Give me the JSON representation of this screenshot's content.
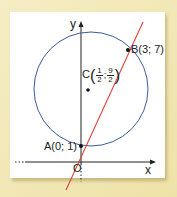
{
  "diagram": {
    "type": "coordinate-geometry",
    "axes": {
      "x_label": "x",
      "y_label": "y",
      "origin_label": "O"
    },
    "circle": {
      "center_label": "C",
      "center": {
        "x_num": "1",
        "x_den": "2",
        "sep": ";",
        "y_num": "9",
        "y_den": "2"
      },
      "color": "#3a5aa0"
    },
    "line": {
      "color": "#d9453a",
      "through": [
        "A",
        "B"
      ]
    },
    "points": [
      {
        "name": "A",
        "label": "A(0; 1)"
      },
      {
        "name": "B",
        "label": "B(3; 7)"
      },
      {
        "name": "C",
        "label": "C"
      }
    ]
  },
  "colors": {
    "background": "#f2e8b6",
    "panel": "#ffffff",
    "axis": "#222222",
    "circle": "#3a5aa0",
    "line": "#d9453a"
  }
}
